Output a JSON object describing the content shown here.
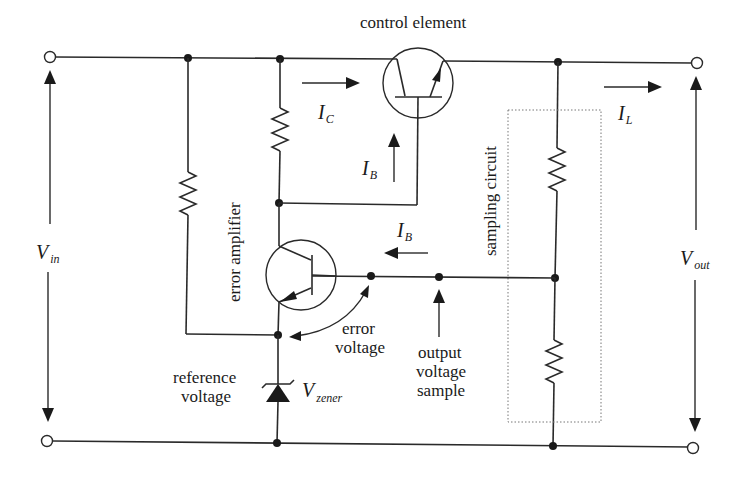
{
  "diagram": {
    "labels": {
      "control_element": "control element",
      "error_amplifier": "error amplifier",
      "sampling_circuit": "sampling circuit",
      "reference_voltage_line1": "reference",
      "reference_voltage_line2": "voltage",
      "error_voltage_line1": "error",
      "error_voltage_line2": "voltage",
      "output_sample_line1": "output",
      "output_sample_line2": "voltage",
      "output_sample_line3": "sample"
    },
    "symbols": {
      "I_C": {
        "main": "I",
        "sub": "C"
      },
      "I_B_top": {
        "main": "I",
        "sub": "B"
      },
      "I_B_mid": {
        "main": "I",
        "sub": "B"
      },
      "I_L": {
        "main": "I",
        "sub": "L"
      },
      "V_in": {
        "main": "V",
        "sub": "in"
      },
      "V_out": {
        "main": "V",
        "sub": "out"
      },
      "V_zener": {
        "main": "V",
        "sub": "zener"
      }
    },
    "components": [
      {
        "id": "Q1",
        "type": "npn-transistor",
        "role": "control element"
      },
      {
        "id": "Q2",
        "type": "npn-transistor",
        "role": "error amplifier"
      },
      {
        "id": "R1",
        "type": "resistor",
        "role": "zener bias"
      },
      {
        "id": "R2",
        "type": "resistor",
        "role": "collector load"
      },
      {
        "id": "R3",
        "type": "resistor",
        "role": "sampling divider upper"
      },
      {
        "id": "R4",
        "type": "resistor",
        "role": "sampling divider lower"
      },
      {
        "id": "D1",
        "type": "zener-diode",
        "role": "reference voltage"
      }
    ]
  }
}
